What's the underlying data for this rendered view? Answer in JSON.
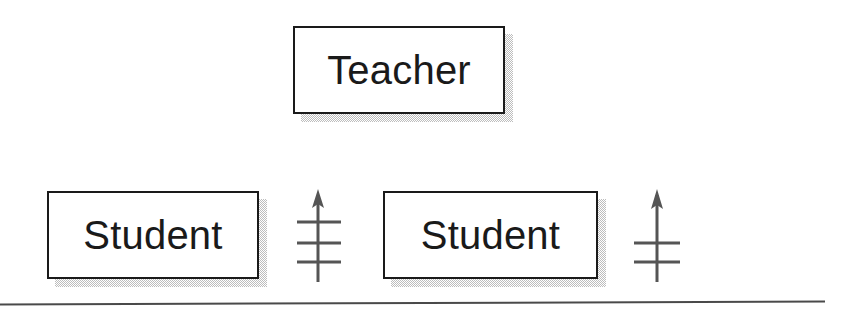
{
  "diagram": {
    "background_color": "#ffffff",
    "line_color": "#1a1a1a",
    "shadow_color": "#bdbdbd",
    "nodes": [
      {
        "id": "teacher",
        "label": "Teacher",
        "x": 293,
        "y": 26,
        "width": 212,
        "height": 88
      },
      {
        "id": "student1",
        "label": "Student",
        "x": 47,
        "y": 191,
        "width": 212,
        "height": 88
      },
      {
        "id": "student2",
        "label": "Student",
        "x": 383,
        "y": 191,
        "width": 215,
        "height": 88
      }
    ],
    "symbols": [
      {
        "id": "arrow1",
        "type": "up-arrow-with-crossbars",
        "crossbar_count": 3,
        "x": 297,
        "y": 188,
        "width": 46,
        "height": 98
      },
      {
        "id": "arrow2",
        "type": "up-arrow-with-crossbars",
        "crossbar_count": 2,
        "x": 634,
        "y": 188,
        "width": 48,
        "height": 98
      }
    ],
    "rule": {
      "id": "bottom-rule",
      "x_start": 0,
      "x_end": 825,
      "y_left": 304,
      "y_right": 301
    }
  }
}
